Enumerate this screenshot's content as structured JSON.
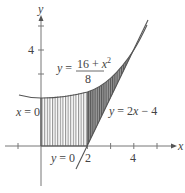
{
  "diagram": {
    "type": "region-between-curves",
    "axes": {
      "x_label": "x",
      "y_label": "y",
      "x_ticks": [
        -2,
        0,
        2,
        4,
        6
      ],
      "x_tick_labels": [
        {
          "value": 2,
          "label": "2"
        },
        {
          "value": 4,
          "label": "4"
        }
      ],
      "y_tick_labels": [
        {
          "value": 4,
          "label": "4"
        }
      ]
    },
    "curves": [
      {
        "name": "parabola",
        "equation_lhs": "y =",
        "numerator": "16 + x",
        "exponent": "2",
        "denominator": "8"
      },
      {
        "name": "line",
        "label": "y = 2x − 4"
      }
    ],
    "boundaries": [
      {
        "name": "x-equals-0",
        "label": "x = 0"
      },
      {
        "name": "y-equals-0",
        "label": "y = 0"
      }
    ],
    "tangent_point": {
      "x": 4,
      "y": 4
    },
    "colors": {
      "axis": "#777777",
      "curve": "#555555",
      "hatch": "#8a8a8a",
      "dark_fill": "#6e6e6e",
      "text": "#444444"
    }
  }
}
